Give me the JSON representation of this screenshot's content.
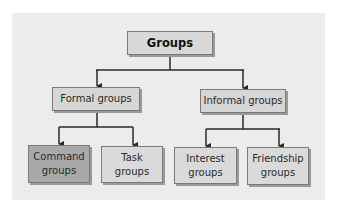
{
  "diagram": {
    "title": "Groups",
    "level1": [
      {
        "label": "Formal groups"
      },
      {
        "label": "Informal groups"
      }
    ],
    "level2": [
      {
        "label": "Command\ngroups",
        "parent": "Formal groups",
        "highlighted": true
      },
      {
        "label": "Task\ngroups",
        "parent": "Formal groups",
        "highlighted": false
      },
      {
        "label": "Interest\ngroups",
        "parent": "Informal groups",
        "highlighted": false
      },
      {
        "label": "Friendship\ngroups",
        "parent": "Informal groups",
        "highlighted": false
      }
    ],
    "colors": {
      "panel": "#ececec",
      "box": "#d8d8d8",
      "highlighted_box": "#a9a9a9",
      "line": "#2a2a2a"
    }
  }
}
